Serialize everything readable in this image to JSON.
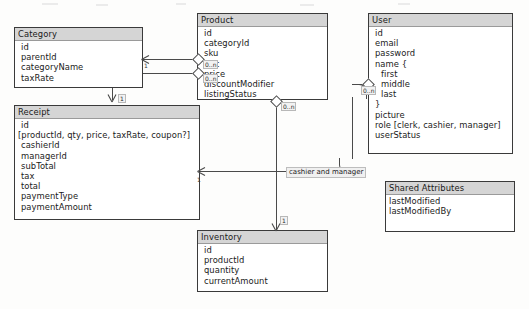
{
  "diagram": {
    "entities": [
      {
        "key": "category",
        "name": "Category",
        "fields": [
          "id",
          "parentId",
          "categoryName",
          "taxRate"
        ]
      },
      {
        "key": "receipt",
        "name": "Receipt",
        "fields": [
          "id",
          "[productId, qty, price, taxRate, coupon?]",
          "cashierId",
          "managerId",
          "subTotal",
          "tax",
          "total",
          "paymentType",
          "paymentAmount"
        ]
      },
      {
        "key": "product",
        "name": "Product",
        "fields": [
          "id",
          "categoryId",
          "sku",
          "upc",
          "price",
          "discountModifier",
          "listingStatus"
        ]
      },
      {
        "key": "inventory",
        "name": "Inventory",
        "fields": [
          "id",
          "productId",
          "quantity",
          "currentAmount"
        ]
      },
      {
        "key": "user",
        "name": "User",
        "fields": [
          "id",
          "email",
          "password",
          "name {",
          "first",
          "middle",
          "last",
          "}",
          "picture",
          "role [clerk, cashier, manager]",
          "userStatus"
        ]
      },
      {
        "key": "shared",
        "name": "Shared Attributes",
        "fields": [
          "lastModified",
          "lastModifiedBy"
        ]
      }
    ],
    "labels": {
      "category_self_one": "1",
      "category_to_receipt_one": "1",
      "product_to_category_many": "0..n",
      "product_to_receipt_many": "0..n",
      "product_to_inventory_many": "0..n",
      "user_to_receipt_many": "0..n",
      "receipt_from_user_one": "1",
      "inventory_one": "1",
      "cashier_and_manager": "cashier and manager"
    },
    "colors": {
      "header_fill": "#d5d5d5",
      "border": "#3a3a3a",
      "line": "#4a4a4a",
      "canvas": "#fdfdfc"
    }
  }
}
